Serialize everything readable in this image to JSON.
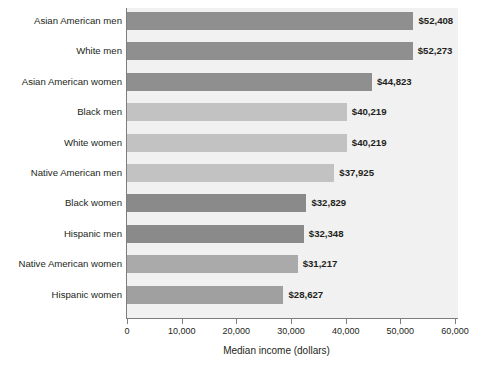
{
  "chart_data": {
    "type": "bar",
    "orientation": "horizontal",
    "title": "",
    "xlabel": "Median income (dollars)",
    "ylabel": "",
    "xlim": [
      0,
      60000
    ],
    "grid": false,
    "legend": null,
    "xticks": [
      "0",
      "10,000",
      "20,000",
      "30,000",
      "40,000",
      "50,000",
      "60,000"
    ],
    "xtick_values": [
      0,
      10000,
      20000,
      30000,
      40000,
      50000,
      60000
    ],
    "categories": [
      "Asian American men",
      "White men",
      "Asian American women",
      "Black men",
      "White women",
      "Native American men",
      "Black women",
      "Hispanic men",
      "Native American women",
      "Hispanic women"
    ],
    "values": [
      52408,
      52273,
      44823,
      40219,
      40219,
      37925,
      32829,
      32348,
      31217,
      28627
    ],
    "value_labels": [
      "$52,408",
      "$52,273",
      "$44,823",
      "$40,219",
      "$40,219",
      "$37,925",
      "$32,829",
      "$32,348",
      "$31,217",
      "$28,627"
    ],
    "bar_colors": [
      "#8f8f8f",
      "#8f8f8f",
      "#8f8f8f",
      "#c2c2c2",
      "#c2c2c2",
      "#c2c2c2",
      "#8a8a8a",
      "#8a8a8a",
      "#aaaaaa",
      "#a0a0a0"
    ],
    "plot_background": "#f1f1f1",
    "axis_color": "#7d7d7d",
    "text_color": "#231f20"
  }
}
